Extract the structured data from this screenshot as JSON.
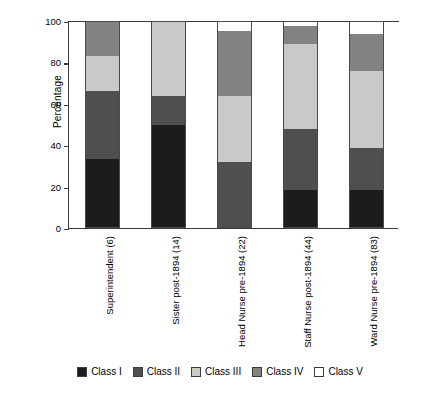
{
  "chart_data": {
    "type": "bar",
    "subtype": "stacked-bar-100",
    "title": "",
    "xlabel": "",
    "ylabel": "Percentage",
    "ylim": [
      0,
      100
    ],
    "yticks": [
      0,
      20,
      40,
      60,
      80,
      100
    ],
    "ytick_labels": [
      "0",
      "20",
      "40",
      "60",
      "80",
      "100"
    ],
    "grid": false,
    "legend_position": "bottom",
    "categories": [
      "Superintendent (6)",
      "Sister post-1894 (14)",
      "Head Nurse pre-1894 (22)",
      "Staff Nurse post-1894 (44)",
      "Ward Nurse pre-1894 (83)"
    ],
    "series": [
      {
        "name": "Class I",
        "color": "#1c1c1c",
        "values": [
          33.3,
          50.0,
          0.0,
          18.5,
          18.5
        ]
      },
      {
        "name": "Class II",
        "color": "#4f4f4f",
        "values": [
          32.7,
          14.0,
          32.0,
          29.5,
          20.0
        ]
      },
      {
        "name": "Class III",
        "color": "#c9c9c9",
        "values": [
          17.0,
          36.0,
          32.0,
          41.0,
          37.5
        ]
      },
      {
        "name": "Class IV",
        "color": "#828282",
        "values": [
          17.0,
          0.0,
          31.0,
          8.5,
          17.5
        ]
      },
      {
        "name": "Class V",
        "color": "#ffffff",
        "values": [
          0.0,
          0.0,
          5.0,
          2.5,
          6.5
        ]
      }
    ],
    "legend": [
      "Class I",
      "Class II",
      "Class III",
      "Class IV",
      "Class V"
    ]
  },
  "axis": {
    "y_title": "Percentage"
  }
}
